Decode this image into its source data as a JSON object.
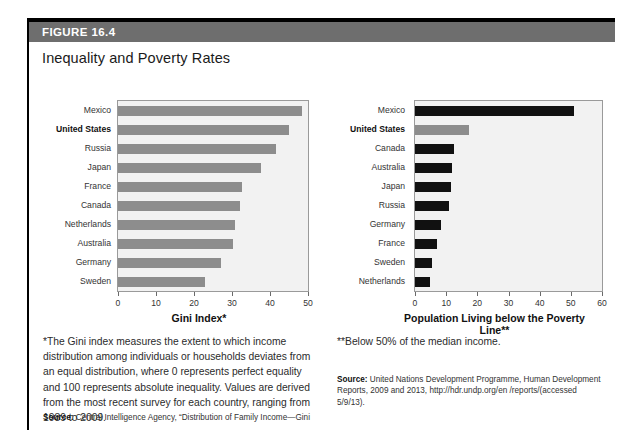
{
  "figure": {
    "header_label": "FIGURE 16.4",
    "title": "Inequality and Poverty Rates"
  },
  "left_panel": {
    "axis_title": "Gini Index*",
    "footnote": "*The Gini index measures the extent to which income distribution among individuals or households deviates from an equal distribution, where 0 represents perfect equality and 100 represents absolute inequality. Values are derived from the most recent survey for each country, ranging from 1989 to 2009.",
    "source_prefix": "Source:",
    "source_text": "Central Intelligence Agency, “Distribution of Family Income—Gini"
  },
  "right_panel": {
    "axis_title": "Population Living below the Poverty Line**",
    "footnote": "**Below 50% of the median income.",
    "source_prefix": "Source:",
    "source_text": "United Nations Development Programme, Human Development Reports, 2009 and 2013, http://hdr.undp.org/en /reports/(accessed 5/9/13)."
  },
  "chart_data": [
    {
      "id": "gini",
      "type": "bar",
      "orientation": "horizontal",
      "title": "",
      "xlabel": "Gini Index*",
      "ylabel": "",
      "xlim": [
        0,
        50
      ],
      "xticks": [
        0,
        10,
        20,
        30,
        40,
        50
      ],
      "grid": false,
      "legend": "none",
      "bar_color": "#8d8d8d",
      "highlight_color": "#8d8d8d",
      "plot_background": "#f2f2f2",
      "highlight_category": "United States",
      "categories": [
        "Mexico",
        "United States",
        "Russia",
        "Japan",
        "France",
        "Canada",
        "Netherlands",
        "Australia",
        "Germany",
        "Sweden"
      ],
      "values": [
        48.3,
        45.0,
        41.7,
        37.6,
        32.7,
        32.1,
        30.9,
        30.3,
        27.0,
        23.0
      ]
    },
    {
      "id": "poverty",
      "type": "bar",
      "orientation": "horizontal",
      "title": "",
      "xlabel": "Population Living below the Poverty Line**",
      "ylabel": "",
      "xlim": [
        0,
        60
      ],
      "xticks": [
        0,
        10,
        20,
        30,
        40,
        50,
        60
      ],
      "grid": false,
      "legend": "none",
      "bar_color": "#111111",
      "highlight_color": "#8d8d8d",
      "plot_background": "#f2f2f2",
      "highlight_category": "United States",
      "categories": [
        "Mexico",
        "United States",
        "Canada",
        "Australia",
        "Japan",
        "Russia",
        "Germany",
        "France",
        "Sweden",
        "Netherlands"
      ],
      "values": [
        51.0,
        17.3,
        12.6,
        12.0,
        11.6,
        11.0,
        8.3,
        7.2,
        5.4,
        4.9
      ]
    }
  ]
}
